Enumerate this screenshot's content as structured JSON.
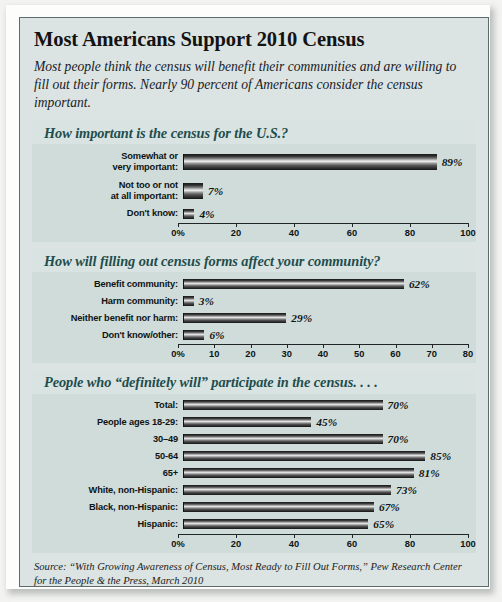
{
  "headline": "Most Americans Support 2010 Census",
  "deck": "Most people think the census will benefit their communities and are willing to fill out their forms. Nearly 90 percent of Americans consider the census important.",
  "source": "Source: “With Growing Awareness of Census, Most Ready to Fill Out Forms,” Pew Research Center for the People & the Press, March 2010",
  "colors": {
    "page_background": "#dbe4e3",
    "panel_background": "#cfdcda",
    "panel_header_background": "#d9e4e2",
    "panel_header_text": "#1f4d4d",
    "label_text": "#0e1414",
    "bar_dark": "#151515",
    "bar_highlight": "#e9e9e9",
    "frame": "#5c6a6a"
  },
  "chart_data": [
    {
      "type": "bar",
      "orientation": "horizontal",
      "title": "How important is the census for the U.S.?",
      "xlabel": "",
      "ylabel": "",
      "xlim": [
        0,
        100
      ],
      "ticks": [
        "0%",
        "20",
        "40",
        "60",
        "80",
        "100"
      ],
      "tick_values": [
        0,
        20,
        40,
        60,
        80,
        100
      ],
      "grid": false,
      "legend": "none",
      "categories": [
        "Somewhat or\nvery important:",
        "Not too or not\nat all important:",
        "Don't know:"
      ],
      "values": [
        89,
        7,
        4
      ],
      "value_labels": [
        "89%",
        "7%",
        "4%"
      ]
    },
    {
      "type": "bar",
      "orientation": "horizontal",
      "title": "How will filling out census forms affect your community?",
      "xlabel": "",
      "ylabel": "",
      "xlim": [
        0,
        80
      ],
      "ticks": [
        "0%",
        "10",
        "20",
        "30",
        "40",
        "50",
        "60",
        "70",
        "80"
      ],
      "tick_values": [
        0,
        10,
        20,
        30,
        40,
        50,
        60,
        70,
        80
      ],
      "grid": false,
      "legend": "none",
      "categories": [
        "Benefit community:",
        "Harm community:",
        "Neither benefit nor harm:",
        "Don't know/other:"
      ],
      "values": [
        62,
        3,
        29,
        6
      ],
      "value_labels": [
        "62%",
        "3%",
        "29%",
        "6%"
      ]
    },
    {
      "type": "bar",
      "orientation": "horizontal",
      "title": "People who “definitely will” participate in the census. . . .",
      "xlabel": "",
      "ylabel": "",
      "xlim": [
        0,
        100
      ],
      "ticks": [
        "0%",
        "20",
        "40",
        "60",
        "80",
        "100"
      ],
      "tick_values": [
        0,
        20,
        40,
        60,
        80,
        100
      ],
      "grid": false,
      "legend": "none",
      "categories": [
        "Total:",
        "People ages 18-29:",
        "30–49",
        "50-64",
        "65+",
        "White, non-Hispanic:",
        "Black, non-Hispanic:",
        "Hispanic:"
      ],
      "values": [
        70,
        45,
        70,
        85,
        81,
        73,
        67,
        65
      ],
      "value_labels": [
        "70%",
        "45%",
        "70%",
        "85%",
        "81%",
        "73%",
        "67%",
        "65%"
      ]
    }
  ]
}
